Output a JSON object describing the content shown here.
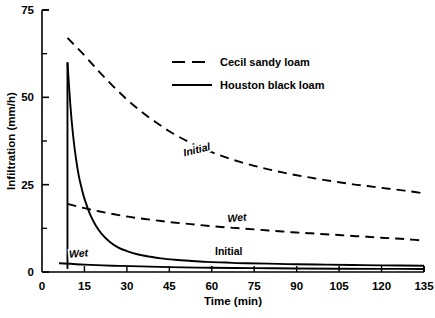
{
  "chart_data": {
    "type": "line",
    "title": "",
    "xlabel": "Time (min)",
    "ylabel": "Infiltration  (mm/h)",
    "xlim": [
      0,
      135
    ],
    "ylim": [
      0,
      75
    ],
    "xticks": [
      0,
      15,
      30,
      45,
      60,
      75,
      90,
      105,
      120,
      135
    ],
    "xtick_labels": [
      "0",
      "15",
      "30",
      "45",
      "60",
      "75",
      "90",
      "105",
      "120",
      "135"
    ],
    "yticks": [
      0,
      25,
      50,
      75
    ],
    "ytick_labels": [
      "0",
      "25",
      "50",
      "75"
    ],
    "yticks_minor": [
      12.5,
      37.5,
      62.5
    ],
    "grid": false,
    "legend_position": "upper-center-right",
    "legend": [
      {
        "name": "Cecil sandy loam",
        "style": "dashed"
      },
      {
        "name": "Houston black loam",
        "style": "solid"
      }
    ],
    "series": [
      {
        "name": "Cecil sandy loam - Initial",
        "soil": "Cecil sandy loam",
        "condition": "Initial",
        "style": "dashed",
        "x": [
          9,
          15,
          20,
          25,
          30,
          35,
          40,
          45,
          50,
          55,
          60,
          65,
          70,
          75,
          80,
          85,
          90,
          95,
          100,
          105,
          110,
          115,
          120,
          125,
          130,
          135
        ],
        "y": [
          67.0,
          62.0,
          57.5,
          53.3,
          49.4,
          46.0,
          43.0,
          40.3,
          38.0,
          36.0,
          34.3,
          32.8,
          31.5,
          30.4,
          29.4,
          28.5,
          27.7,
          27.0,
          26.3,
          25.7,
          25.1,
          24.6,
          24.1,
          23.6,
          23.1,
          22.5
        ]
      },
      {
        "name": "Cecil sandy loam - Wet",
        "soil": "Cecil sandy loam",
        "condition": "Wet",
        "style": "dashed",
        "x": [
          9,
          15,
          20,
          25,
          30,
          35,
          40,
          45,
          50,
          55,
          60,
          65,
          70,
          75,
          80,
          85,
          90,
          95,
          100,
          105,
          110,
          115,
          120,
          125,
          130,
          135
        ],
        "y": [
          19.5,
          18.3,
          17.4,
          16.6,
          15.9,
          15.3,
          14.8,
          14.3,
          13.9,
          13.5,
          13.1,
          12.8,
          12.5,
          12.2,
          11.9,
          11.6,
          11.3,
          11.1,
          10.8,
          10.6,
          10.3,
          10.1,
          9.8,
          9.6,
          9.3,
          9.0
        ]
      },
      {
        "name": "Houston black loam - Initial",
        "soil": "Houston black loam",
        "condition": "Initial",
        "style": "solid",
        "x": [
          9,
          10,
          11,
          12,
          13,
          14,
          15,
          17,
          19,
          21,
          24,
          27,
          30,
          34,
          38,
          42,
          47,
          52,
          58,
          65,
          72,
          80,
          90,
          100,
          110,
          120,
          135
        ],
        "y": [
          60.0,
          48.0,
          39.0,
          32.5,
          27.5,
          24.0,
          21.0,
          16.5,
          13.3,
          11.0,
          8.6,
          7.0,
          6.0,
          5.0,
          4.4,
          3.9,
          3.5,
          3.2,
          2.9,
          2.7,
          2.5,
          2.4,
          2.2,
          2.1,
          2.0,
          1.9,
          1.8
        ]
      },
      {
        "name": "Houston black loam - Wet",
        "soil": "Houston black loam",
        "condition": "Wet",
        "style": "solid",
        "x": [
          6,
          15,
          25,
          35,
          45,
          60,
          75,
          90,
          105,
          120,
          135
        ],
        "y": [
          2.5,
          2.1,
          1.8,
          1.6,
          1.4,
          1.2,
          1.1,
          1.0,
          0.95,
          0.9,
          0.85
        ]
      }
    ],
    "annotations": [
      {
        "text": "Initial",
        "for": "Cecil sandy loam - Initial",
        "x": 55,
        "y": 34,
        "italic": true,
        "rotation": -14
      },
      {
        "text": "Wet",
        "for": "Cecil sandy loam - Wet",
        "x": 69,
        "y": 14.5,
        "italic": true,
        "rotation": -5
      },
      {
        "text": "Initial",
        "for": "Houston black loam - Initial",
        "x": 66,
        "y": 5.0,
        "italic": false,
        "rotation": 0
      },
      {
        "text": "Wet",
        "for": "Houston black loam - Wet",
        "x": 13,
        "y": 4.3,
        "italic": true,
        "rotation": -4
      }
    ],
    "colors": {
      "line": "#000000",
      "axis": "#000000",
      "background": "#ffffff"
    }
  }
}
